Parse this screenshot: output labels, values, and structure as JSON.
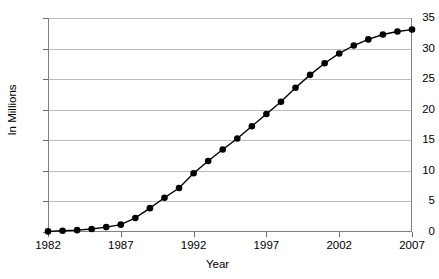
{
  "chart_data": {
    "type": "line",
    "title": "",
    "xlabel": "Year",
    "ylabel": "In Millions",
    "xlim": [
      1982,
      2007
    ],
    "ylim": [
      0,
      35
    ],
    "grid": true,
    "legend": false,
    "marker": "filled-circle",
    "line_color": "#000000",
    "marker_color": "#000000",
    "grid_color": "#bdbdbd",
    "x": [
      1982,
      1983,
      1984,
      1985,
      1986,
      1987,
      1988,
      1989,
      1990,
      1991,
      1992,
      1993,
      1994,
      1995,
      1996,
      1997,
      1998,
      1999,
      2000,
      2001,
      2002,
      2003,
      2004,
      2005,
      2006,
      2007
    ],
    "values": [
      0.1,
      0.2,
      0.3,
      0.5,
      0.8,
      1.2,
      2.3,
      3.9,
      5.6,
      7.2,
      9.6,
      11.6,
      13.5,
      15.3,
      17.3,
      19.3,
      21.3,
      23.6,
      25.7,
      27.6,
      29.2,
      30.5,
      31.5,
      32.3,
      32.8,
      33.1
    ],
    "xticks": [
      1982,
      1987,
      1992,
      1997,
      2002,
      2007
    ],
    "xtick_labels": [
      "1982",
      "1987",
      "1992",
      "1997",
      "2002",
      "2007"
    ],
    "yticks": [
      0,
      5,
      10,
      15,
      20,
      25,
      30,
      35
    ],
    "ytick_labels": [
      "0",
      "5",
      "10",
      "15",
      "20",
      "25",
      "30",
      "35"
    ]
  }
}
